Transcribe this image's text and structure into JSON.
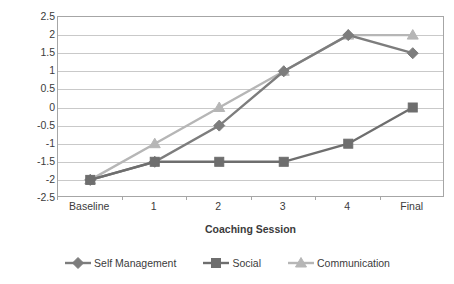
{
  "chart_data": {
    "type": "line",
    "title": "",
    "xlabel": "Coaching Session",
    "ylabel": "GAS Score",
    "categories": [
      "Baseline",
      "1",
      "2",
      "3",
      "4",
      "Final"
    ],
    "ylim": [
      -2.5,
      2.5
    ],
    "ytick_step": 0.5,
    "yticks": [
      "2.5",
      "2",
      "1.5",
      "1",
      "0.5",
      "0",
      "-0.5",
      "-1",
      "-1.5",
      "-2",
      "-2.5"
    ],
    "ytick_values": [
      2.5,
      2,
      1.5,
      1,
      0.5,
      0,
      -0.5,
      -1,
      -1.5,
      -2,
      -2.5
    ],
    "grid": true,
    "grid_axis": "y",
    "legend_position": "bottom",
    "series": [
      {
        "name": "Self Management",
        "marker": "diamond",
        "color": "#7d7d7d",
        "values": [
          -2,
          -1.5,
          -0.5,
          1,
          2,
          1.5
        ]
      },
      {
        "name": "Social",
        "marker": "square",
        "color": "#6e6e6e",
        "values": [
          -2,
          -1.5,
          -1.5,
          -1.5,
          -1,
          0
        ]
      },
      {
        "name": "Communication",
        "marker": "triangle",
        "color": "#b6b6b6",
        "values": [
          -2,
          -1,
          0,
          1,
          2,
          2
        ]
      }
    ]
  },
  "axis": {
    "y_title": "GAS Score",
    "x_title": "Coaching Session"
  },
  "legend": {
    "items": [
      {
        "label": "Self Management"
      },
      {
        "label": "Social"
      },
      {
        "label": "Communication"
      }
    ]
  },
  "colors": {
    "gridline": "#c9c9c9",
    "plot_border": "#a6a6a6",
    "text": "#3b3b3b",
    "background": "#ffffff"
  }
}
